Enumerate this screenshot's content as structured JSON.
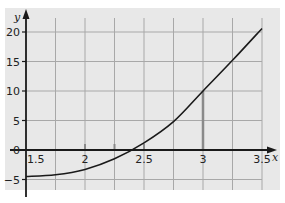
{
  "chart_data": {
    "type": "line",
    "title": "",
    "xlabel": "x",
    "ylabel": "y",
    "xlim": [
      1.5,
      3.5
    ],
    "ylim": [
      -7,
      22
    ],
    "grid": true,
    "x_ticks": [
      "1.5",
      "2",
      "2.5",
      "3",
      "3.5"
    ],
    "y_ticks": [
      "-5",
      "0",
      "5",
      "10",
      "15",
      "20"
    ],
    "series": [
      {
        "name": "curve",
        "x": [
          1.5,
          1.75,
          2.0,
          2.25,
          2.5,
          2.75,
          3.0,
          3.25,
          3.5
        ],
        "y": [
          -4.5,
          -4.2,
          -3.3,
          -1.5,
          1.2,
          4.8,
          10.0,
          15.2,
          20.6
        ]
      }
    ],
    "annotations": [
      {
        "type": "vertical-segment",
        "x": 3.0,
        "from": 0,
        "to": 10.0
      },
      {
        "type": "tick-mark",
        "x": 2.0
      },
      {
        "type": "tick-mark",
        "x": 2.25
      },
      {
        "type": "tick-mark",
        "x": 2.5
      }
    ],
    "colors": {
      "background": "#e8e8e8",
      "grid": "#a8a8a8",
      "axis": "#1a1a1a",
      "curve": "#1a1a1a",
      "segment": "#8a8a8a"
    }
  }
}
